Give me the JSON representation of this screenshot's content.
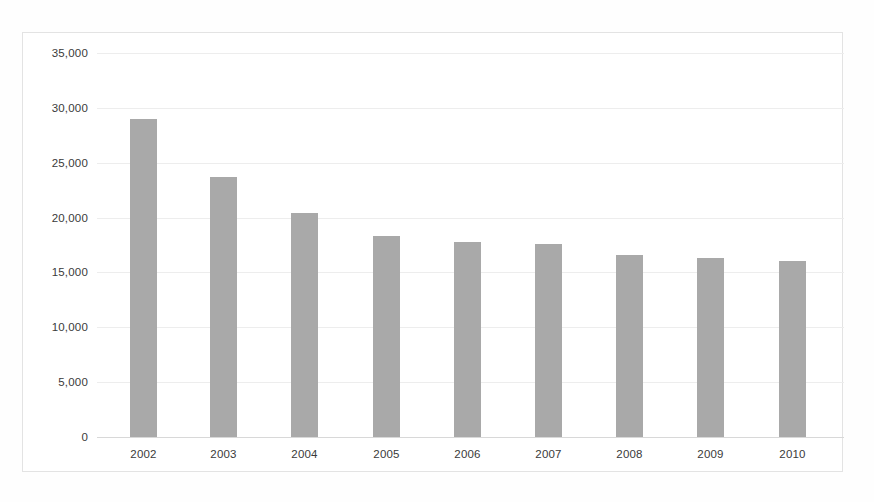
{
  "chart_data": {
    "type": "bar",
    "title": "",
    "subtitle": "",
    "xlabel": "",
    "ylabel": "",
    "categories": [
      "2002",
      "2003",
      "2004",
      "2005",
      "2006",
      "2007",
      "2008",
      "2009",
      "2010"
    ],
    "values": [
      29000,
      23700,
      20400,
      18300,
      17800,
      17600,
      16600,
      16300,
      16000
    ],
    "series": [
      {
        "name": "",
        "values": [
          29000,
          23700,
          20400,
          18300,
          17800,
          17600,
          16600,
          16300,
          16000
        ]
      }
    ],
    "ylim": [
      0,
      35000
    ],
    "ytick_values": [
      0,
      5000,
      10000,
      15000,
      20000,
      25000,
      30000,
      35000
    ],
    "ytick_labels": [
      "0",
      "5,000",
      "10,000",
      "15,000",
      "20,000",
      "25,000",
      "30,000",
      "35,000"
    ],
    "grid": true,
    "grid_axis": "y",
    "legend": false,
    "legend_position": "none",
    "bar_color": "#a9a9a9",
    "grid_color": "#ededed",
    "axis_color": "#d8d8d8",
    "text_color": "#3a3a3a",
    "background_color": "#ffffff",
    "annotations": []
  }
}
